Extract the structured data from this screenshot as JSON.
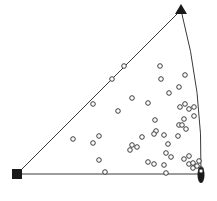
{
  "diagram": {
    "type": "stereographic-triangle",
    "colors": {
      "background": "#ffffff",
      "outline": "#3a3a3a",
      "marker": "#1a1a1a",
      "point_stroke": "#2a2a2a",
      "point_fill": "#ffffff"
    },
    "corners": {
      "left": {
        "shape": "square",
        "x": 17,
        "y": 174
      },
      "top": {
        "shape": "triangle",
        "x": 181,
        "y": 10
      },
      "right": {
        "shape": "ellipse",
        "x": 201,
        "y": 175
      }
    },
    "points": [
      [
        124,
        66
      ],
      [
        112,
        79
      ],
      [
        93,
        104
      ],
      [
        160,
        66
      ],
      [
        161,
        79
      ],
      [
        185,
        75
      ],
      [
        179,
        87
      ],
      [
        169,
        93
      ],
      [
        132,
        98
      ],
      [
        148,
        103
      ],
      [
        118,
        111
      ],
      [
        185,
        104
      ],
      [
        180,
        107
      ],
      [
        189,
        109
      ],
      [
        194,
        107
      ],
      [
        194,
        116
      ],
      [
        184,
        119
      ],
      [
        155,
        120
      ],
      [
        179,
        125
      ],
      [
        182,
        125
      ],
      [
        186,
        129
      ],
      [
        156,
        131
      ],
      [
        154,
        134
      ],
      [
        164,
        135
      ],
      [
        178,
        136
      ],
      [
        142,
        137
      ],
      [
        99,
        136
      ],
      [
        73,
        139
      ],
      [
        93,
        143
      ],
      [
        168,
        144
      ],
      [
        132,
        145
      ],
      [
        137,
        147
      ],
      [
        130,
        150
      ],
      [
        166,
        153
      ],
      [
        171,
        157
      ],
      [
        189,
        156
      ],
      [
        184,
        159
      ],
      [
        99,
        160
      ],
      [
        148,
        162
      ],
      [
        154,
        164
      ],
      [
        164,
        165
      ],
      [
        189,
        164
      ],
      [
        193,
        163
      ],
      [
        199,
        161
      ],
      [
        193,
        168
      ],
      [
        197,
        166
      ],
      [
        105,
        172
      ],
      [
        166,
        173
      ],
      [
        201,
        169
      ]
    ]
  }
}
